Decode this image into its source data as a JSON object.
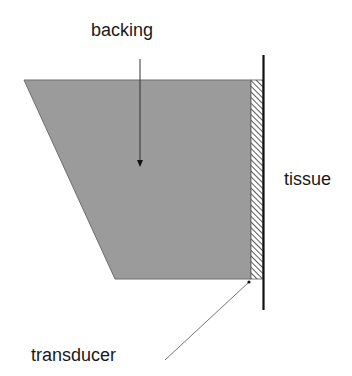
{
  "diagram": {
    "type": "ultrasound-transducer-cross-section",
    "labels": {
      "backing": "backing",
      "tissue": "tissue",
      "transducer": "transducer"
    },
    "colors": {
      "backing_fill": "#9b9b9b",
      "backing_stroke": "#6e6e6e",
      "tissue_line": "#111111",
      "hatch": "#333333",
      "leader": "#555555",
      "text": "#1a1a1a"
    },
    "shapes": {
      "backing_polygon": [
        [
          24,
          80
        ],
        [
          251,
          80
        ],
        [
          251,
          279
        ],
        [
          115,
          279
        ]
      ],
      "transducer_rect": {
        "x": 251,
        "y": 80,
        "width": 12,
        "height": 199
      },
      "tissue_line": {
        "x": 263,
        "y1": 55,
        "y2": 310
      },
      "backing_arrow": {
        "x": 140,
        "y1": 59,
        "y2": 166
      },
      "transducer_leader": {
        "x1": 249,
        "y1": 282,
        "x2": 165,
        "y2": 360
      }
    }
  }
}
